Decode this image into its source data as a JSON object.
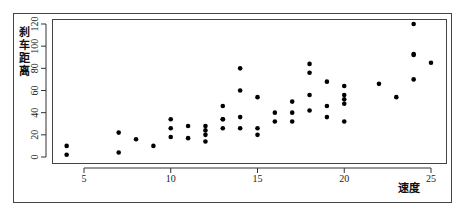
{
  "chart_data": {
    "type": "scatter",
    "title": "",
    "xlabel": "速度",
    "ylabel": "刹车距离",
    "ylabel_chars": [
      "刹",
      "车",
      "距",
      "离"
    ],
    "xlim": [
      4,
      25
    ],
    "ylim": [
      0,
      120
    ],
    "xticks": [
      5,
      10,
      15,
      20,
      25
    ],
    "yticks": [
      0,
      20,
      40,
      60,
      80,
      100,
      120
    ],
    "grid": false,
    "legend": null,
    "points": [
      [
        4,
        2
      ],
      [
        4,
        10
      ],
      [
        7,
        4
      ],
      [
        7,
        22
      ],
      [
        8,
        16
      ],
      [
        9,
        10
      ],
      [
        10,
        18
      ],
      [
        10,
        26
      ],
      [
        10,
        34
      ],
      [
        11,
        17
      ],
      [
        11,
        28
      ],
      [
        12,
        14
      ],
      [
        12,
        20
      ],
      [
        12,
        24
      ],
      [
        12,
        28
      ],
      [
        13,
        26
      ],
      [
        13,
        34
      ],
      [
        13,
        34
      ],
      [
        13,
        46
      ],
      [
        14,
        26
      ],
      [
        14,
        36
      ],
      [
        14,
        60
      ],
      [
        14,
        80
      ],
      [
        15,
        20
      ],
      [
        15,
        26
      ],
      [
        15,
        54
      ],
      [
        16,
        32
      ],
      [
        16,
        40
      ],
      [
        17,
        32
      ],
      [
        17,
        40
      ],
      [
        17,
        50
      ],
      [
        18,
        42
      ],
      [
        18,
        56
      ],
      [
        18,
        76
      ],
      [
        18,
        84
      ],
      [
        19,
        36
      ],
      [
        19,
        46
      ],
      [
        19,
        68
      ],
      [
        20,
        32
      ],
      [
        20,
        48
      ],
      [
        20,
        52
      ],
      [
        20,
        56
      ],
      [
        20,
        64
      ],
      [
        22,
        66
      ],
      [
        23,
        54
      ],
      [
        24,
        70
      ],
      [
        24,
        92
      ],
      [
        24,
        93
      ],
      [
        24,
        120
      ],
      [
        25,
        85
      ]
    ]
  },
  "colors": {
    "point": "#000000",
    "axis": "#333333",
    "frame": "#444444"
  }
}
